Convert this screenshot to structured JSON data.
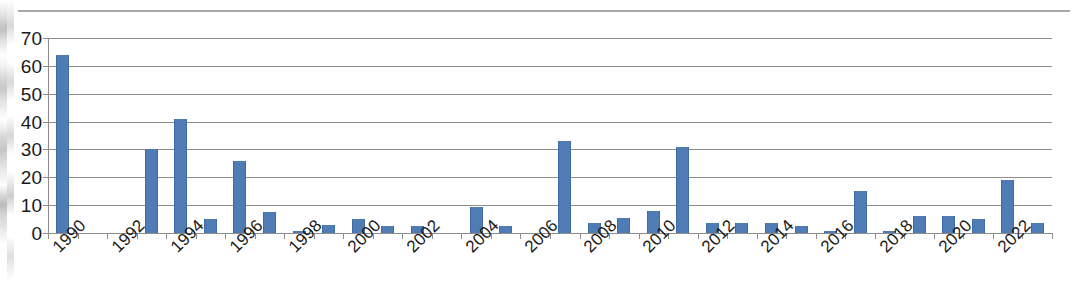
{
  "chart_data": {
    "type": "bar",
    "title": "",
    "subtitle": "",
    "xlabel": "",
    "ylabel": "",
    "categories": [
      1990,
      1991,
      1992,
      1993,
      1994,
      1995,
      1996,
      1997,
      1998,
      1999,
      2000,
      2001,
      2002,
      2003,
      2004,
      2005,
      2006,
      2007,
      2008,
      2009,
      2010,
      2011,
      2012,
      2013,
      2014,
      2015,
      2016,
      2017,
      2018,
      2019,
      2020,
      2021,
      2022,
      2023
    ],
    "values": [
      64,
      0,
      0,
      30,
      41,
      5,
      26,
      7.5,
      0.7,
      3,
      5,
      2.5,
      2.5,
      0,
      9.5,
      2.5,
      0,
      33,
      3.5,
      5.5,
      8,
      31,
      3.5,
      3.5,
      3.5,
      2.5,
      0.8,
      15,
      0.7,
      6,
      6,
      5,
      19,
      3.5
    ],
    "ylim": [
      0,
      70
    ],
    "ytick_values": [
      0,
      10,
      20,
      30,
      40,
      50,
      60,
      70
    ],
    "ytick_labels": [
      "0",
      "10",
      "20",
      "30",
      "40",
      "50",
      "60",
      "70"
    ],
    "xtick_labels_shown": [
      "1990",
      "1992",
      "1994",
      "1996",
      "1998",
      "2000",
      "2002",
      "2004",
      "2006",
      "2008",
      "2010",
      "2012",
      "2014",
      "2016",
      "2018",
      "2020",
      "2022"
    ],
    "xtick_label_interval": 2,
    "xtick_label_rotation": -45,
    "grid": "horizontal",
    "legend": "none",
    "series": [
      {
        "name": "",
        "color": "#4f7cb5",
        "values": [
          64,
          0,
          0,
          30,
          41,
          5,
          26,
          7.5,
          0.7,
          3,
          5,
          2.5,
          2.5,
          0,
          9.5,
          2.5,
          0,
          33,
          3.5,
          5.5,
          8,
          31,
          3.5,
          3.5,
          3.5,
          2.5,
          0.8,
          15,
          0.7,
          6,
          6,
          5,
          19,
          3.5
        ]
      }
    ]
  },
  "colors": {
    "bar": "#4f7cb5",
    "bar_edge": "#3f6ba4",
    "gridline": "#8d8d8d",
    "axis": "#8d8d8d",
    "text": "#1a1a1a",
    "background": "#ffffff"
  }
}
